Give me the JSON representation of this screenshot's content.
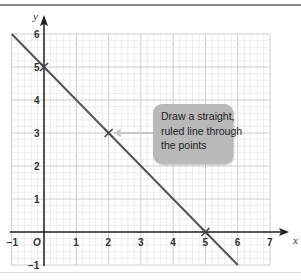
{
  "diagram": {
    "axes": {
      "x_label": "x",
      "y_label": "y",
      "x_ticks": [
        "-1",
        "1",
        "2",
        "3",
        "4",
        "5",
        "6",
        "7"
      ],
      "y_ticks": [
        "-1",
        "1",
        "2",
        "3",
        "4",
        "5",
        "6"
      ],
      "origin_label": "O",
      "x_range": [
        -1,
        7
      ],
      "y_range": [
        -1,
        6
      ]
    },
    "points": [
      {
        "x": 0,
        "y": 5
      },
      {
        "x": 2,
        "y": 3
      },
      {
        "x": 5,
        "y": 0
      }
    ],
    "line": {
      "equation": "y = 5 - x",
      "from": [
        -1,
        6
      ],
      "to": [
        6,
        -1
      ]
    },
    "callout": {
      "text": "Draw a straight,\nruled line through\nthe points",
      "points_to": [
        2,
        3
      ]
    },
    "colors": {
      "line": "#555555",
      "grid_minor": "#e2e2e2",
      "grid_major": "#c8c8c8",
      "axis": "#222222",
      "callout_bg": "#b9b9b9",
      "arrow": "#c8c8c8"
    }
  }
}
